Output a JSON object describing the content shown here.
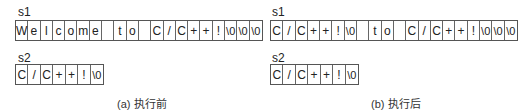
{
  "panels": [
    {
      "id": "a",
      "caption": "(a) 执行前",
      "s1": {
        "label": "s1",
        "cells": [
          "W",
          "e",
          "l",
          "c",
          "o",
          "m",
          "e",
          " ",
          "t",
          "o",
          " ",
          "C",
          "/",
          "C",
          "+",
          "+",
          "!",
          "\\0",
          "\\0",
          "\\0"
        ]
      },
      "s2": {
        "label": "s2",
        "cells": [
          "C",
          "/",
          "C",
          "+",
          "+",
          "!",
          "\\0"
        ]
      }
    },
    {
      "id": "b",
      "caption": "(b) 执行后",
      "s1": {
        "label": "s1",
        "cells": [
          "C",
          "/",
          "C",
          "+",
          "+",
          "!",
          "\\0",
          " ",
          "t",
          "o",
          " ",
          "C",
          "/",
          "C",
          "+",
          "+",
          "!",
          "\\0",
          "\\0",
          "\\0"
        ]
      },
      "s2": {
        "label": "s2",
        "cells": [
          "C",
          "/",
          "C",
          "+",
          "+",
          "!",
          "\\0"
        ]
      }
    }
  ]
}
